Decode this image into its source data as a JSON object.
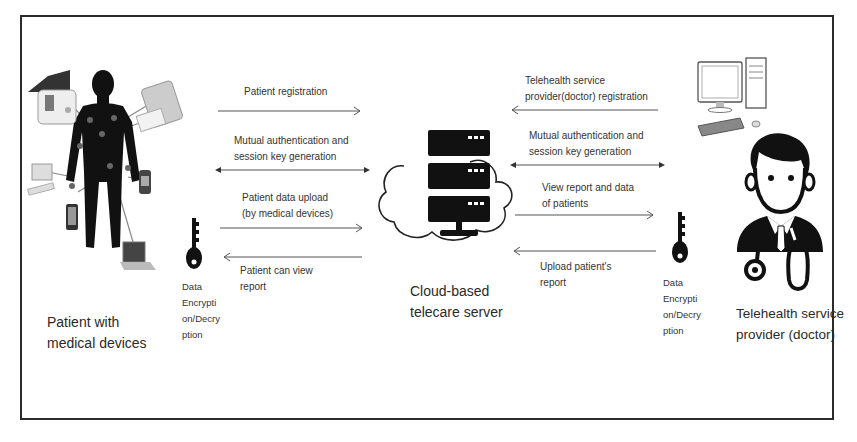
{
  "diagram": {
    "nodes": {
      "patient": {
        "label": "Patient with\nmedical devices",
        "icon": "patient-with-medical-devices-icon"
      },
      "server": {
        "label": "Cloud-based\ntelecare server",
        "icon": "cloud-server-icon"
      },
      "doctor": {
        "label": "Telehealth service\nprovider (doctor)",
        "icon": "doctor-icon"
      },
      "computer": {
        "icon": "desktop-computer-icon"
      },
      "key_left": {
        "label": "Data\nEncrypti\non/Decry\nption",
        "icon": "key-icon"
      },
      "key_right": {
        "label": "Data\nEncrypti\non/Decry\nption",
        "icon": "key-icon"
      }
    },
    "left_flows": [
      {
        "label": "Patient registration",
        "direction": "to-server"
      },
      {
        "label": "Mutual authentication and\nsession key generation",
        "direction": "bidirectional"
      },
      {
        "label": "Patient data upload\n(by medical devices)",
        "direction": "to-server"
      },
      {
        "label": "Patient can view\nreport",
        "direction": "to-patient"
      }
    ],
    "right_flows": [
      {
        "label": "Telehealth service\nprovider(doctor) registration",
        "direction": "to-server"
      },
      {
        "label": "Mutual authentication and\nsession key generation",
        "direction": "bidirectional"
      },
      {
        "label": "View report and data\nof patients",
        "direction": "to-doctor"
      },
      {
        "label": "Upload patient's\nreport",
        "direction": "to-server"
      }
    ],
    "colors": {
      "line": "#555555",
      "icon": "#111111",
      "border": "#2b2b2b"
    }
  }
}
